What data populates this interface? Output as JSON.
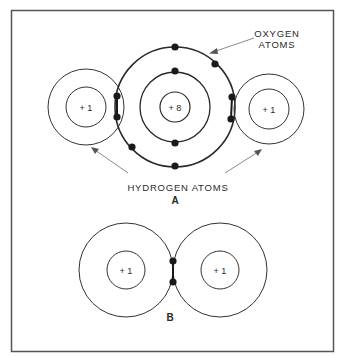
{
  "figure": {
    "panel_a": {
      "label": "A",
      "oxygen_label_line1": "OXYGEN",
      "oxygen_label_line2": "ATOMS",
      "hydrogen_label": "HYDROGEN ATOMS",
      "oxygen_nucleus": "+ 8",
      "hydrogen_left_nucleus": "+ 1",
      "hydrogen_right_nucleus": "+ 1"
    },
    "panel_b": {
      "label": "B",
      "hydrogen_left_nucleus": "+ 1",
      "hydrogen_right_nucleus": "+ 1"
    }
  },
  "colors": {
    "line": "#2a2a2a",
    "arrow": "#8a8a8a",
    "frame": "#555555",
    "electron": "#1a1a1a"
  }
}
